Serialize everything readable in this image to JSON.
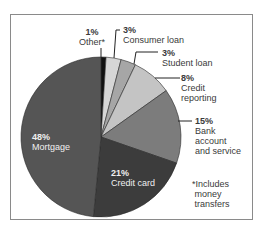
{
  "chart_data": {
    "type": "pie",
    "title": "",
    "categories": [
      "Other*",
      "Consumer loan",
      "Student loan",
      "Credit reporting",
      "Bank account and service",
      "Credit card",
      "Mortgage"
    ],
    "values": [
      1,
      3,
      3,
      8,
      15,
      21,
      48
    ],
    "unit": "%",
    "colors": [
      "#111111",
      "#d6d6d6",
      "#a6a6a6",
      "#c4c4c4",
      "#7c7c7c",
      "#3c3c3c",
      "#555555"
    ],
    "footnote": "*Includes money transfers",
    "legend": "none (direct labels)"
  },
  "labels": {
    "other": {
      "pct": "1%",
      "name": "Other*"
    },
    "consumer": {
      "pct": "3%",
      "name": "Consumer loan"
    },
    "student": {
      "pct": "3%",
      "name": "Student loan"
    },
    "credit_reporting": {
      "pct": "8%",
      "name1": "Credit",
      "name2": "reporting"
    },
    "bank": {
      "pct": "15%",
      "name1": "Bank",
      "name2": "account",
      "name3": "and service"
    },
    "credit_card": {
      "pct": "21%",
      "name": "Credit card"
    },
    "mortgage": {
      "pct": "48%",
      "name": "Mortgage"
    }
  },
  "footnote": {
    "line1": "*Includes",
    "line2": "money",
    "line3": "transfers"
  }
}
